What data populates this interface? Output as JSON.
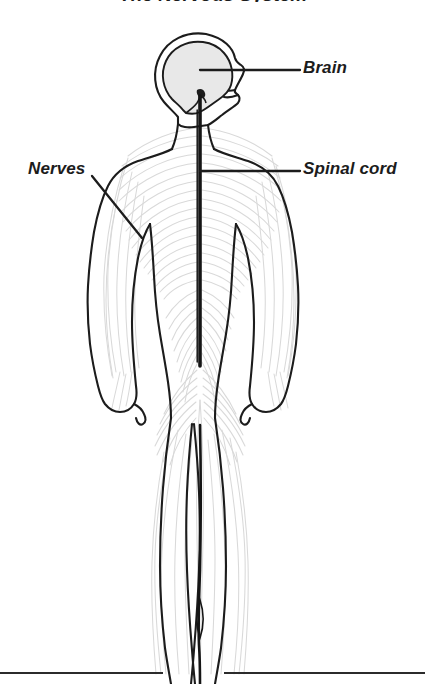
{
  "figure": {
    "title": "The Nervous System",
    "title_visible_fraction": "cropped",
    "width": 425,
    "height": 684,
    "background_color": "#ffffff"
  },
  "labels": [
    {
      "id": "brain",
      "text": "Brain",
      "style": "bold-italic",
      "color": "#1c1c1c",
      "leader_from": [
        200,
        70
      ],
      "leader_to": [
        300,
        70
      ]
    },
    {
      "id": "spinal_cord",
      "text": "Spinal cord",
      "style": "bold-italic",
      "color": "#1c1c1c",
      "leader_from": [
        200,
        171
      ],
      "leader_to": [
        300,
        171
      ]
    },
    {
      "id": "nerves",
      "text": "Nerves",
      "style": "bold-italic",
      "color": "#1c1c1c",
      "leader_from": [
        92,
        176
      ],
      "leader_to": [
        142,
        238
      ]
    }
  ],
  "anatomy": {
    "body_outline": {
      "name": "human-body-outline",
      "view": "anterior full body with head in right profile",
      "stroke_color": "#1c1c1c",
      "stroke_width": 2.1,
      "fill": "#ffffff"
    },
    "brain": {
      "name": "brain",
      "fill_color": "#e8e8e8",
      "stroke_color": "#1c1c1c",
      "location": "inside cranium, upper head"
    },
    "spinal_cord": {
      "name": "spinal-cord",
      "stroke_color": "#151515",
      "stroke_width": 3.4,
      "top_y": 96,
      "bottom_y": 366,
      "x": 200
    },
    "lower_cord_extension": {
      "name": "cauda-equina-line",
      "stroke_color": "#151515",
      "top_y": 425,
      "bottom_y": 684,
      "x": 200
    },
    "nerves": {
      "name": "peripheral-nerve-network",
      "stroke_color": "#d9d9d9",
      "stroke_width": 1.1,
      "description": "bilaterally symmetric fanning nerve branches across torso, arms, pelvis and legs"
    }
  },
  "baseline": {
    "name": "ground-line",
    "y": 673,
    "color": "#2b2b2b",
    "stroke_width": 2
  }
}
